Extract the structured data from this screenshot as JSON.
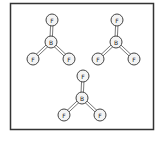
{
  "diagram": {
    "molecules": [
      {
        "central": "B",
        "ligands": [
          "F",
          "F",
          "F"
        ]
      },
      {
        "central": "B",
        "ligands": [
          "F",
          "F",
          "F"
        ]
      },
      {
        "central": "B",
        "ligands": [
          "F",
          "F",
          "F"
        ]
      }
    ],
    "colors": {
      "frame": "#333333",
      "atom_fill": "#f4f4f4",
      "atom_stroke": "#444444"
    }
  }
}
